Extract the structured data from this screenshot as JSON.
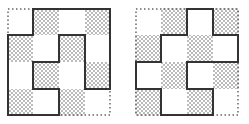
{
  "figure": {
    "grid_size": 4,
    "shade_rule": "shaded when (row + col) is odd",
    "colors": {
      "outline": "#333333",
      "dots": "#555555",
      "dotted_border": "#666666",
      "background": "#ffffff"
    },
    "panels": [
      {
        "id": "left",
        "outline_cells": [
          [
            1,
            0
          ],
          [
            4,
            0
          ],
          [
            4,
            3
          ],
          [
            3,
            3
          ],
          [
            3,
            1
          ],
          [
            2,
            1
          ],
          [
            2,
            2
          ],
          [
            1,
            2
          ],
          [
            1,
            3
          ],
          [
            2,
            3
          ],
          [
            2,
            4
          ],
          [
            0,
            4
          ],
          [
            0,
            1
          ],
          [
            1,
            1
          ]
        ]
      },
      {
        "id": "right",
        "outline_cells": [
          [
            2,
            0
          ],
          [
            3,
            0
          ],
          [
            3,
            1
          ],
          [
            4,
            1
          ],
          [
            4,
            2
          ],
          [
            2,
            2
          ],
          [
            2,
            3
          ],
          [
            3,
            3
          ],
          [
            3,
            4
          ],
          [
            1,
            4
          ],
          [
            1,
            3
          ],
          [
            0,
            3
          ],
          [
            0,
            2
          ],
          [
            1,
            2
          ],
          [
            1,
            1
          ],
          [
            2,
            1
          ]
        ]
      }
    ]
  }
}
